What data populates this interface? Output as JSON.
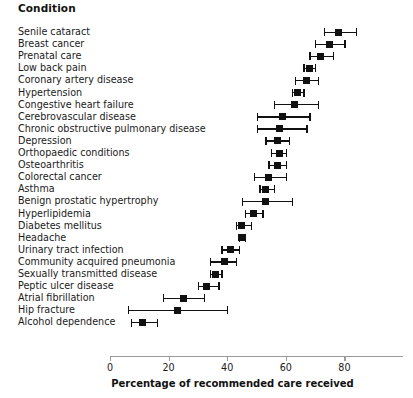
{
  "header": {
    "column_title": "Condition"
  },
  "axis": {
    "x_title": "Percentage of recommended care received",
    "ticks": [
      0,
      20,
      40,
      60,
      80
    ],
    "tick_labels": [
      "0",
      "20",
      "40",
      "60",
      "80"
    ]
  },
  "chart_data": {
    "type": "scatter",
    "orientation": "horizontal",
    "title": "",
    "xlabel": "Percentage of recommended care received",
    "ylabel": "Condition",
    "xlim": [
      0,
      97
    ],
    "grid": false,
    "legend": null,
    "error_bars": "95% confidence interval",
    "categories": [
      "Senile cataract",
      "Breast cancer",
      "Prenatal care",
      "Low back pain",
      "Coronary artery disease",
      "Hypertension",
      "Congestive heart failure",
      "Cerebrovascular disease",
      "Chronic obstructive pulmonary disease",
      "Depression",
      "Orthopaedic conditions",
      "Osteoarthritis",
      "Colorectal cancer",
      "Asthma",
      "Benign prostatic hypertrophy",
      "Hyperlipidemia",
      "Diabetes mellitus",
      "Headache",
      "Urinary tract infection",
      "Community acquired pneumonia",
      "Sexually transmitted disease",
      "Peptic ulcer disease",
      "Atrial fibrillation",
      "Hip fracture",
      "Alcohol dependence"
    ],
    "values": [
      78,
      75,
      72,
      68,
      67,
      64,
      63,
      59,
      58,
      57,
      58,
      57,
      54,
      53,
      53,
      49,
      45,
      45,
      41,
      39,
      36,
      33,
      25,
      23,
      11
    ],
    "ci_low": [
      73,
      70,
      68,
      66,
      63,
      62,
      56,
      50,
      50,
      53,
      55,
      54,
      49,
      51,
      45,
      46,
      43,
      44,
      38,
      34,
      34,
      30,
      18,
      6,
      7
    ],
    "ci_high": [
      84,
      80,
      76,
      70,
      71,
      66,
      71,
      68,
      67,
      61,
      60,
      60,
      60,
      56,
      62,
      52,
      48,
      46,
      44,
      43,
      38,
      37,
      32,
      40,
      16
    ],
    "points": [
      {
        "label": "Senile cataract",
        "value": 78,
        "low": 73,
        "high": 84
      },
      {
        "label": "Breast cancer",
        "value": 75,
        "low": 70,
        "high": 80
      },
      {
        "label": "Prenatal care",
        "value": 72,
        "low": 68,
        "high": 76
      },
      {
        "label": "Low back pain",
        "value": 68,
        "low": 66,
        "high": 70
      },
      {
        "label": "Coronary artery disease",
        "value": 67,
        "low": 63,
        "high": 71
      },
      {
        "label": "Hypertension",
        "value": 64,
        "low": 62,
        "high": 66
      },
      {
        "label": "Congestive heart failure",
        "value": 63,
        "low": 56,
        "high": 71
      },
      {
        "label": "Cerebrovascular disease",
        "value": 59,
        "low": 50,
        "high": 68
      },
      {
        "label": "Chronic obstructive pulmonary disease",
        "value": 58,
        "low": 50,
        "high": 67
      },
      {
        "label": "Depression",
        "value": 57,
        "low": 53,
        "high": 61
      },
      {
        "label": "Orthopaedic conditions",
        "value": 58,
        "low": 55,
        "high": 60
      },
      {
        "label": "Osteoarthritis",
        "value": 57,
        "low": 54,
        "high": 60
      },
      {
        "label": "Colorectal cancer",
        "value": 54,
        "low": 49,
        "high": 60
      },
      {
        "label": "Asthma",
        "value": 53,
        "low": 51,
        "high": 56
      },
      {
        "label": "Benign prostatic hypertrophy",
        "value": 53,
        "low": 45,
        "high": 62
      },
      {
        "label": "Hyperlipidemia",
        "value": 49,
        "low": 46,
        "high": 52
      },
      {
        "label": "Diabetes mellitus",
        "value": 45,
        "low": 43,
        "high": 48
      },
      {
        "label": "Headache",
        "value": 45,
        "low": 44,
        "high": 46
      },
      {
        "label": "Urinary tract infection",
        "value": 41,
        "low": 38,
        "high": 44
      },
      {
        "label": "Community acquired pneumonia",
        "value": 39,
        "low": 34,
        "high": 43
      },
      {
        "label": "Sexually transmitted disease",
        "value": 36,
        "low": 34,
        "high": 38
      },
      {
        "label": "Peptic ulcer disease",
        "value": 33,
        "low": 30,
        "high": 37
      },
      {
        "label": "Atrial fibrillation",
        "value": 25,
        "low": 18,
        "high": 32
      },
      {
        "label": "Hip fracture",
        "value": 23,
        "low": 6,
        "high": 40
      },
      {
        "label": "Alcohol dependence",
        "value": 11,
        "low": 7,
        "high": 16
      }
    ]
  },
  "style": {
    "marker_color": "#111111",
    "axis_color": "#9a9a9a",
    "text_color": "#1a1a1a",
    "background": "#ffffff"
  }
}
